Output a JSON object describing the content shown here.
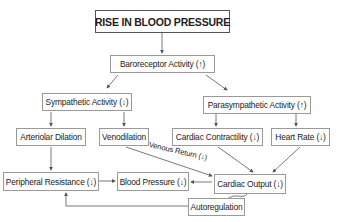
{
  "title": "RISE IN BLOOD PRESSURE",
  "nodes": {
    "baroreceptor": "Baroreceptor Activity (↑)",
    "sympathetic": "Sympathetic Activity (↓)",
    "parasympathetic": "Parasympathetic Activity (↑)",
    "arteriolar": "Arteriolar Dilation",
    "venodilation": "Venodilation",
    "contractility": "Cardiac Contractility (↓)",
    "heart_rate": "Heart Rate (↓)",
    "peripheral": "Peripheral Resistance (↓)",
    "blood_pressure": "Blood Pressure (↓)",
    "cardiac_output": "Cardiac Output (↓)",
    "autoregulation": "Autoregulation"
  },
  "edge_labels": {
    "venous_return": "Venous Return (↓)"
  },
  "colors": {
    "line": "#555555",
    "box_border": "#9a9a9a",
    "title_border": "#555555"
  }
}
